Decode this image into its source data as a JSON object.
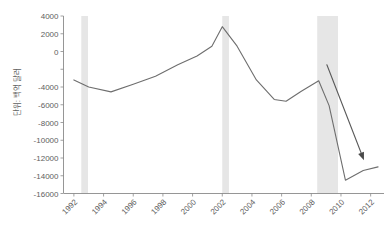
{
  "chart_data": {
    "type": "line",
    "title": "",
    "xlabel": "",
    "ylabel": "단위: 백억 달러",
    "xlim": [
      1991.3,
      2012.9
    ],
    "ylim": [
      -16000,
      4000
    ],
    "grid": false,
    "legend": "none",
    "y_ticks": [
      4000,
      2000,
      0,
      -2000,
      -4000,
      -6000,
      -8000,
      -10000,
      -12000,
      -14000,
      -16000
    ],
    "y_tick_labels": [
      "4000",
      "2000",
      "0",
      "",
      "-4000",
      "-6000",
      "-8000",
      "-10000",
      "-12000",
      "-14000",
      "-16000"
    ],
    "x_ticks": [
      1992,
      1994,
      1996,
      1998,
      2000,
      2002,
      2004,
      2006,
      2008,
      2010,
      2012
    ],
    "x_tick_labels": [
      "1992",
      "1994",
      "1996",
      "1998",
      "2000",
      "2002",
      "2004",
      "2006",
      "2008",
      "2010",
      "2012"
    ],
    "series": [
      {
        "name": "balance",
        "color": "#6e6e6e",
        "x": [
          1992.0,
          1993.0,
          1994.5,
          1996.0,
          1997.5,
          1999.0,
          2000.3,
          2001.3,
          2002.0,
          2003.0,
          2004.3,
          2005.5,
          2006.3,
          2007.3,
          2008.5,
          2009.2,
          2010.3,
          2011.5,
          2012.5
        ],
        "values": [
          -3200,
          -4000,
          -4550,
          -3700,
          -2800,
          -1500,
          -500,
          600,
          2800,
          600,
          -3200,
          -5400,
          -5600,
          -4500,
          -3300,
          -6100,
          -14500,
          -13400,
          -13000
        ]
      }
    ],
    "recession_bands": [
      {
        "start": 1992.5,
        "end": 1992.95
      },
      {
        "start": 2002.0,
        "end": 2002.45
      },
      {
        "start": 2008.4,
        "end": 2009.8
      }
    ],
    "annotations": [
      {
        "type": "arrow",
        "x_start": 2009.05,
        "y_start": -1500,
        "x_end": 2011.55,
        "y_end": -12250,
        "color": "#5a5a5a"
      }
    ],
    "colors": {
      "line": "#6e6e6e",
      "recession_band": "#e6e6e6",
      "axis": "#8a8a8a",
      "text": "#5e5e5e",
      "background": "#ffffff"
    }
  }
}
